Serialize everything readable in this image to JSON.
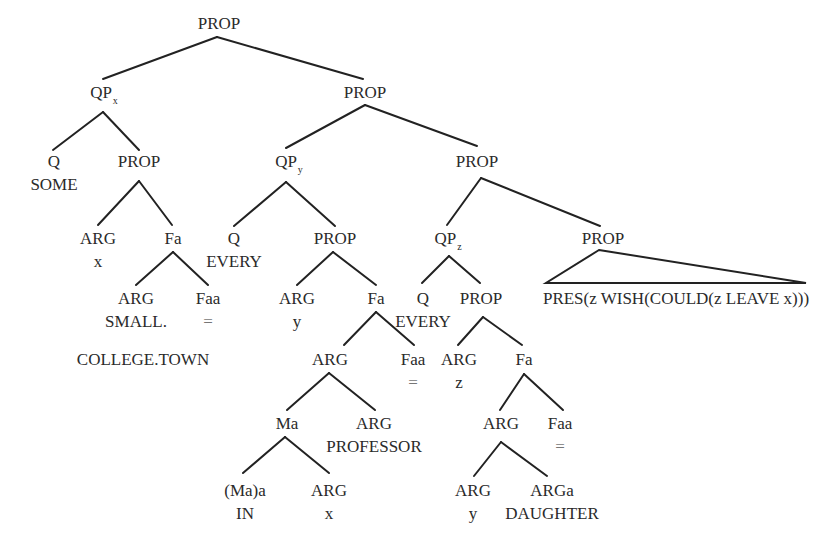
{
  "diagram": {
    "type": "syntax-tree",
    "nodes": {
      "root": {
        "label": "PROP"
      },
      "qpx": {
        "label": "QP",
        "sub": "x"
      },
      "prop1": {
        "label": "PROP"
      },
      "q_some": {
        "label": "Q",
        "word": "SOME"
      },
      "prop_x": {
        "label": "PROP"
      },
      "qpy": {
        "label": "QP",
        "sub": "y"
      },
      "prop2": {
        "label": "PROP"
      },
      "arg_x": {
        "label": "ARG",
        "word": "x"
      },
      "fa_x": {
        "label": "Fa"
      },
      "q_every_y": {
        "label": "Q",
        "word": "EVERY"
      },
      "prop_y": {
        "label": "PROP"
      },
      "qpz": {
        "label": "QP",
        "sub": "z"
      },
      "prop3": {
        "label": "PROP"
      },
      "arg_small": {
        "label": "ARG",
        "word": "SMALL."
      },
      "faa_x": {
        "label": "Faa",
        "word": "="
      },
      "college_town": {
        "label": "COLLEGE.TOWN"
      },
      "arg_y": {
        "label": "ARG",
        "word": "y"
      },
      "fa_y": {
        "label": "Fa"
      },
      "q_every_z": {
        "label": "Q",
        "word": "EVERY"
      },
      "prop_z": {
        "label": "PROP"
      },
      "pres_clause": {
        "label": "PRES(z WISH(COULD(z LEAVE x)))"
      },
      "arg_prof": {
        "label": "ARG"
      },
      "faa_y": {
        "label": "Faa",
        "word": "="
      },
      "arg_z": {
        "label": "ARG",
        "word": "z"
      },
      "fa_z": {
        "label": "Fa"
      },
      "ma": {
        "label": "Ma"
      },
      "arg_professor": {
        "label": "ARG",
        "word": "PROFESSOR"
      },
      "arg_dau": {
        "label": "ARG"
      },
      "faa_z": {
        "label": "Faa",
        "word": "="
      },
      "maa_in": {
        "label": "(Ma)a",
        "word": "IN"
      },
      "arg_x2": {
        "label": "ARG",
        "word": "x"
      },
      "arg_y2": {
        "label": "ARG",
        "word": "y"
      },
      "arga_daughter": {
        "label": "ARGa",
        "word": "DAUGHTER"
      }
    }
  }
}
